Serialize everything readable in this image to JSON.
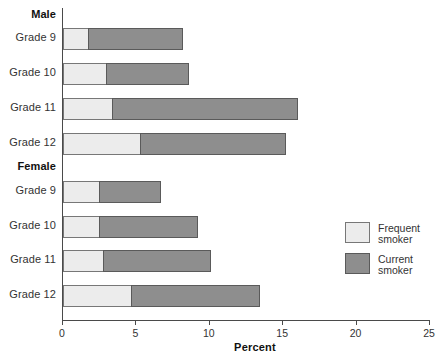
{
  "chart_data": {
    "type": "bar",
    "orientation": "horizontal",
    "stacked": true,
    "title": "",
    "xlabel": "Percent",
    "ylabel": "",
    "xlim": [
      0,
      25
    ],
    "xticks": [
      0,
      5,
      10,
      15,
      20,
      25
    ],
    "xtick_labels": [
      "0",
      "5",
      "10",
      "15",
      "20",
      "25"
    ],
    "grid": false,
    "legend_position": "right",
    "series": [
      {
        "name": "Frequent smoker",
        "color": "#ececec",
        "values": [
          1.8,
          3.0,
          3.4,
          5.3,
          2.5,
          2.5,
          2.8,
          4.7
        ]
      },
      {
        "name": "Current smoker",
        "color": "#8e8e8e",
        "values": [
          6.4,
          5.6,
          12.6,
          9.9,
          4.2,
          6.7,
          7.3,
          8.7
        ]
      }
    ],
    "groups": [
      {
        "label": "Male",
        "categories": [
          "Grade 9",
          "Grade 10",
          "Grade 11",
          "Grade 12"
        ],
        "bars": [
          {
            "category": "Grade 9",
            "frequent": 1.8,
            "current": 6.4,
            "total": 8.2
          },
          {
            "category": "Grade 10",
            "frequent": 3.0,
            "current": 5.6,
            "total": 8.6
          },
          {
            "category": "Grade 11",
            "frequent": 3.4,
            "current": 12.6,
            "total": 16.0
          },
          {
            "category": "Grade 12",
            "frequent": 5.3,
            "current": 9.9,
            "total": 15.2
          }
        ]
      },
      {
        "label": "Female",
        "categories": [
          "Grade 9",
          "Grade 10",
          "Grade 11",
          "Grade 12"
        ],
        "bars": [
          {
            "category": "Grade 9",
            "frequent": 2.5,
            "current": 4.2,
            "total": 6.7
          },
          {
            "category": "Grade 10",
            "frequent": 2.5,
            "current": 6.7,
            "total": 9.2
          },
          {
            "category": "Grade 11",
            "frequent": 2.8,
            "current": 7.3,
            "total": 10.1
          },
          {
            "category": "Grade 12",
            "frequent": 4.7,
            "current": 8.7,
            "total": 13.4
          }
        ]
      }
    ],
    "legend": [
      {
        "label_line1": "Frequent",
        "label_line2": "smoker",
        "color": "#ececec"
      },
      {
        "label_line1": "Current",
        "label_line2": "smoker",
        "color": "#8e8e8e"
      }
    ]
  },
  "colors": {
    "frequent_smoker": "#ececec",
    "current_smoker": "#8e8e8e",
    "axis": "#4a4a4a",
    "background": "#ffffff",
    "text": "#333333"
  }
}
